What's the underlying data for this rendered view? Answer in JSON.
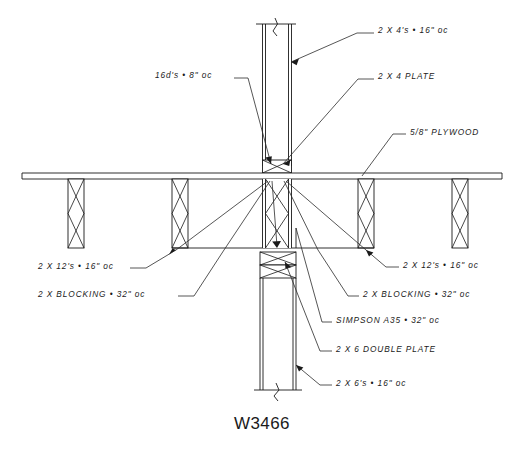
{
  "sheet": {
    "title": "W3466",
    "drawing_type": "architectural-structural-detail",
    "description": "Floor framing to wall connection detail",
    "background_color": "#ffffff",
    "line_color": "#1a1a1a"
  },
  "annotations": [
    {
      "id": "note-2x4s",
      "text": "2 X 4's  •  16\" oc",
      "x": 378,
      "y": 31,
      "align": "left",
      "target": "upper-stud-wall"
    },
    {
      "id": "note-16d-nails",
      "text": "16d's  •  8\" oc",
      "x": 155,
      "y": 75,
      "align": "left",
      "target": "upper-plate-nailing"
    },
    {
      "id": "note-2x4-plate",
      "text": "2 X 4 PLATE",
      "x": 378,
      "y": 77,
      "align": "left",
      "target": "upper-sole-plate"
    },
    {
      "id": "note-plywood",
      "text": "5/8\" PLYWOOD",
      "x": 410,
      "y": 132,
      "align": "left",
      "target": "plywood-sheathing"
    },
    {
      "id": "note-2x12s-left",
      "text": "2 X 12's  •  16\" oc",
      "x": 38,
      "y": 266,
      "align": "left",
      "target": "floor-joist-left"
    },
    {
      "id": "note-2x12s-right",
      "text": "2 X 12's  •  16\" oc",
      "x": 403,
      "y": 265,
      "align": "left",
      "target": "floor-joist-right"
    },
    {
      "id": "note-blocking-left",
      "text": "2 X BLOCKING  •  32\" oc",
      "x": 38,
      "y": 294,
      "align": "left",
      "target": "blocking-left"
    },
    {
      "id": "note-blocking-right",
      "text": "2 X BLOCKING  •  32\" oc",
      "x": 363,
      "y": 294,
      "align": "left",
      "target": "blocking-right"
    },
    {
      "id": "note-simpson-a35",
      "text": "SIMPSON A35  •  32\" oc",
      "x": 336,
      "y": 320,
      "align": "left",
      "target": "simpson-clip"
    },
    {
      "id": "note-double-plate",
      "text": "2 X 6 DOUBLE PLATE",
      "x": 336,
      "y": 349,
      "align": "left",
      "target": "lower-double-plate"
    },
    {
      "id": "note-2x6s",
      "text": "2 X 6's  •  16\" oc",
      "x": 336,
      "y": 383,
      "align": "left",
      "target": "lower-stud-wall"
    }
  ]
}
